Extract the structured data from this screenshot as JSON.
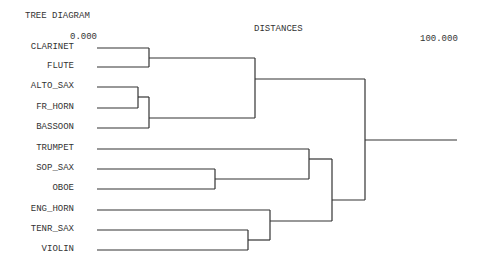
{
  "title": "TREE DIAGRAM",
  "axis": {
    "label": "DISTANCES",
    "min_label": "0.000",
    "max_label": "100.000"
  },
  "leaves": [
    {
      "label": "CLARINET",
      "y": 48
    },
    {
      "label": "FLUTE",
      "y": 67
    },
    {
      "label": "ALTO_SAX",
      "y": 87
    },
    {
      "label": "FR_HORN",
      "y": 108
    },
    {
      "label": "BASSOON",
      "y": 128
    },
    {
      "label": "TRUMPET",
      "y": 149
    },
    {
      "label": "SOP_SAX",
      "y": 169
    },
    {
      "label": "OBOE",
      "y": 189
    },
    {
      "label": "ENG_HORN",
      "y": 210
    },
    {
      "label": "TENR_SAX",
      "y": 230
    },
    {
      "label": "VIOLIN",
      "y": 250
    }
  ],
  "segments": [
    [
      97,
      48,
      149,
      48
    ],
    [
      97,
      67,
      149,
      67
    ],
    [
      149,
      48,
      149,
      67
    ],
    [
      149,
      58,
      255,
      58
    ],
    [
      97,
      87,
      138,
      87
    ],
    [
      97,
      108,
      138,
      108
    ],
    [
      138,
      87,
      138,
      108
    ],
    [
      138,
      97,
      149,
      97
    ],
    [
      97,
      128,
      149,
      128
    ],
    [
      149,
      97,
      149,
      128
    ],
    [
      149,
      118,
      255,
      118
    ],
    [
      255,
      58,
      255,
      118
    ],
    [
      255,
      79,
      365,
      79
    ],
    [
      97,
      149,
      309,
      149
    ],
    [
      97,
      169,
      215,
      169
    ],
    [
      97,
      189,
      215,
      189
    ],
    [
      215,
      169,
      215,
      189
    ],
    [
      215,
      179,
      309,
      179
    ],
    [
      309,
      149,
      309,
      179
    ],
    [
      309,
      159,
      332,
      159
    ],
    [
      97,
      210,
      270,
      210
    ],
    [
      97,
      230,
      248,
      230
    ],
    [
      97,
      250,
      248,
      250
    ],
    [
      248,
      230,
      248,
      250
    ],
    [
      248,
      240,
      270,
      240
    ],
    [
      270,
      210,
      270,
      240
    ],
    [
      270,
      221,
      332,
      221
    ],
    [
      332,
      159,
      332,
      221
    ],
    [
      332,
      200,
      365,
      200
    ],
    [
      365,
      79,
      365,
      200
    ],
    [
      365,
      140,
      457,
      140
    ]
  ],
  "line_color": "#333333"
}
